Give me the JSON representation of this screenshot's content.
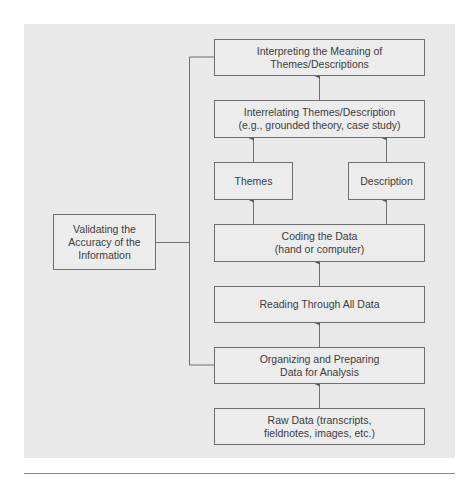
{
  "diagram": {
    "boxes": {
      "interpreting": {
        "line1": "Interpreting the Meaning of",
        "line2": "Themes/Descriptions"
      },
      "interrelating": {
        "line1": "Interrelating Themes/Description",
        "line2": "(e.g., grounded theory, case study)"
      },
      "themes": {
        "label": "Themes"
      },
      "description": {
        "label": "Description"
      },
      "coding": {
        "line1": "Coding the Data",
        "line2": "(hand or computer)"
      },
      "reading": {
        "label": "Reading Through All Data"
      },
      "organizing": {
        "line1": "Organizing and Preparing",
        "line2": "Data for Analysis"
      },
      "raw": {
        "line1": "Raw Data (transcripts,",
        "line2": "fieldnotes, images, etc.)"
      },
      "validating": {
        "line1": "Validating the",
        "line2": "Accuracy of the",
        "line3": "Information"
      }
    },
    "colors": {
      "panel": "#e9e9e9",
      "line": "#6e6e6e",
      "text": "#3c3c3c"
    }
  }
}
